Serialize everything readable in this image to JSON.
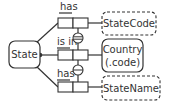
{
  "diagram": {
    "type": "ORM object-role model",
    "entities": [
      {
        "id": "state",
        "label": "State",
        "kind": "entity",
        "border": "solid"
      },
      {
        "id": "statecode",
        "label": "StateCode",
        "kind": "value",
        "border": "dashed"
      },
      {
        "id": "country",
        "label_line1": "Country",
        "label_line2": "(.code)",
        "kind": "entity",
        "border": "solid"
      },
      {
        "id": "statename",
        "label": "StateName",
        "kind": "value",
        "border": "dashed"
      }
    ],
    "facts": [
      {
        "id": "fact-has-code",
        "reading": "has",
        "from": "State",
        "to": "StateCode",
        "mandatory": true
      },
      {
        "id": "fact-is-in",
        "reading": "is in",
        "from": "State",
        "to": "Country",
        "mandatory": true
      },
      {
        "id": "fact-has-name",
        "reading": "has",
        "from": "State",
        "to": "StateName",
        "mandatory": true
      }
    ],
    "constraints": [
      {
        "id": "preferred-identifier",
        "kind": "external uniqueness (preferred, double bar)",
        "between": [
          "fact-has-code",
          "fact-is-in"
        ]
      },
      {
        "id": "external-uniqueness",
        "kind": "external uniqueness (single bar)",
        "between": [
          "fact-is-in",
          "fact-has-name"
        ]
      }
    ],
    "colors": {
      "stroke": "#333333",
      "background": "#ffffff"
    }
  }
}
